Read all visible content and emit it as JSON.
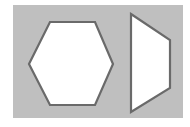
{
  "figure": {
    "name": "geometric-shapes-figure",
    "width": 190,
    "height": 127,
    "page_background": "#ffffff",
    "panel": {
      "name": "gray-background-panel",
      "fill": "#bfbfbf",
      "x": 13,
      "y": 5,
      "width": 170,
      "height": 113
    },
    "style": {
      "shape_fill": "#ffffff",
      "shape_stroke": "#6a6a6a",
      "shape_stroke_width": 2.2
    },
    "shapes": [
      {
        "id": "hexagon",
        "label": "hexagon",
        "sides": 6,
        "orientation": "flat-top",
        "fill": "#ffffff",
        "stroke": "#6a6a6a",
        "points": "29,64 50,22 95,22 113,64 95,105 50,105",
        "bbox": {
          "x": 29,
          "y": 22,
          "width": 84,
          "height": 83
        }
      },
      {
        "id": "trapezoid",
        "label": "trapezoid",
        "sides": 4,
        "orientation": "right-pointing",
        "fill": "#ffffff",
        "stroke": "#6a6a6a",
        "points": "131,14 170,40 170,88 131,112",
        "bbox": {
          "x": 131,
          "y": 14,
          "width": 39,
          "height": 98
        }
      }
    ]
  }
}
